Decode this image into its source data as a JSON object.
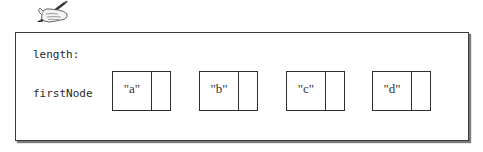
{
  "diagram": {
    "icon": "hand-writing-with-pen-icon",
    "fields": [
      {
        "label": "length:",
        "value": ""
      },
      {
        "label": "firstNode",
        "value": ""
      }
    ],
    "nodes": [
      {
        "data": "\"a\"",
        "next": ""
      },
      {
        "data": "\"b\"",
        "next": ""
      },
      {
        "data": "\"c\"",
        "next": ""
      },
      {
        "data": "\"d\"",
        "next": ""
      }
    ]
  }
}
